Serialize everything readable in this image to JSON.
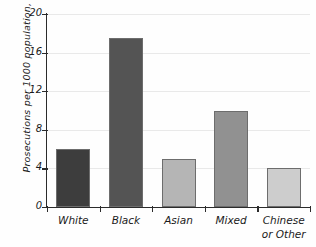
{
  "chart_data": {
    "type": "bar",
    "title": "",
    "xlabel": "",
    "ylabel": "Prosecutions per 1000 population, 2014",
    "categories": [
      "White",
      "Black",
      "Asian",
      "Mixed",
      "Chinese or Other"
    ],
    "category_lines": [
      [
        "White"
      ],
      [
        "Black"
      ],
      [
        "Asian"
      ],
      [
        "Mixed"
      ],
      [
        "Chinese",
        "or Other"
      ]
    ],
    "values": [
      6,
      17.5,
      5,
      10,
      4
    ],
    "ylim": [
      0,
      20
    ],
    "yticks": [
      0,
      4,
      8,
      12,
      16,
      20
    ],
    "ytick_labels": [
      "0",
      "4",
      "8",
      "12",
      "16",
      "20"
    ],
    "grid": true,
    "grid_axis": "y",
    "legend": "none",
    "bar_colors": [
      "#3d3d3d",
      "#545454",
      "#b5b5b5",
      "#919191",
      "#cdcdcd"
    ],
    "bar_border_color": "#6d6d6d",
    "axis_color": "#2b2b2b",
    "gridline_color": "#e9e9e9",
    "background": "#fefefe"
  }
}
